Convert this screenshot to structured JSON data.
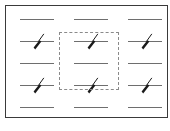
{
  "canvas": {
    "name": "notation-canvas",
    "width": 170,
    "height": 131,
    "frame": {
      "x": 5,
      "y": 5,
      "width": 163,
      "height": 113,
      "border_color": "#3a3a3a"
    },
    "background_color": "#ffffff"
  },
  "grid": {
    "columns": 3,
    "rows": 5,
    "column_x": [
      13,
      67,
      121
    ],
    "row_y": [
      5,
      27,
      49,
      71,
      93
    ],
    "cell_width": 40,
    "cell_height": 18,
    "line_color": "#6e6e6e",
    "mark_color": "#1a1a1a"
  },
  "cells": [
    {
      "id": "r1c1",
      "row": 1,
      "col": 1,
      "glyph": "horizontal-rule",
      "marked": false,
      "selected": false
    },
    {
      "id": "r1c2",
      "row": 1,
      "col": 2,
      "glyph": "horizontal-rule",
      "marked": false,
      "selected": false
    },
    {
      "id": "r1c3",
      "row": 1,
      "col": 3,
      "glyph": "horizontal-rule",
      "marked": false,
      "selected": false
    },
    {
      "id": "r2c1",
      "row": 2,
      "col": 1,
      "glyph": "horizontal-rule-with-slash",
      "marked": true,
      "selected": false
    },
    {
      "id": "r2c2",
      "row": 2,
      "col": 2,
      "glyph": "horizontal-rule-with-slash",
      "marked": true,
      "selected": true
    },
    {
      "id": "r2c3",
      "row": 2,
      "col": 3,
      "glyph": "horizontal-rule-with-slash",
      "marked": true,
      "selected": false
    },
    {
      "id": "r3c1",
      "row": 3,
      "col": 1,
      "glyph": "horizontal-rule",
      "marked": false,
      "selected": false
    },
    {
      "id": "r3c2",
      "row": 3,
      "col": 2,
      "glyph": "horizontal-rule",
      "marked": false,
      "selected": true
    },
    {
      "id": "r3c3",
      "row": 3,
      "col": 3,
      "glyph": "horizontal-rule",
      "marked": false,
      "selected": false
    },
    {
      "id": "r4c1",
      "row": 4,
      "col": 1,
      "glyph": "horizontal-rule-with-slash",
      "marked": true,
      "selected": false
    },
    {
      "id": "r4c2",
      "row": 4,
      "col": 2,
      "glyph": "horizontal-rule-with-slash",
      "marked": true,
      "selected": true
    },
    {
      "id": "r4c3",
      "row": 4,
      "col": 3,
      "glyph": "horizontal-rule-with-slash",
      "marked": true,
      "selected": false
    },
    {
      "id": "r5c1",
      "row": 5,
      "col": 1,
      "glyph": "horizontal-rule",
      "marked": false,
      "selected": false
    },
    {
      "id": "r5c2",
      "row": 5,
      "col": 2,
      "glyph": "horizontal-rule",
      "marked": false,
      "selected": false
    },
    {
      "id": "r5c3",
      "row": 5,
      "col": 3,
      "glyph": "horizontal-rule",
      "marked": false,
      "selected": false
    }
  ],
  "selection": {
    "name": "selection-marquee",
    "visible": true,
    "style": "dashed",
    "color": "#8a8a8a",
    "x": 53,
    "y": 26,
    "width": 60,
    "height": 58,
    "covers_column": 2,
    "covers_rows": [
      2,
      3,
      4
    ]
  }
}
